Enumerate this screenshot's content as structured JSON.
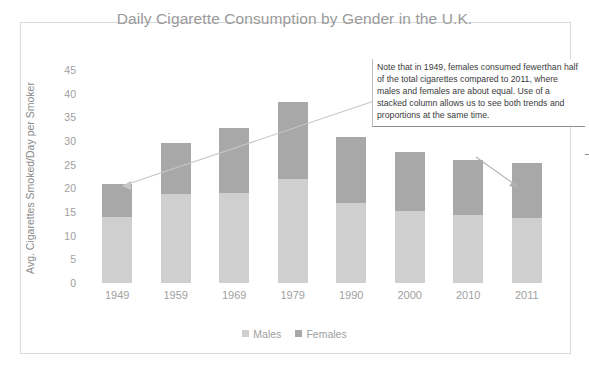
{
  "chart_data": {
    "type": "bar",
    "subtype": "stacked-column",
    "title": "Daily Cigarette Consumption by Gender in the U.K.",
    "xlabel": "",
    "ylabel": "Avg. Cigarettes Smoked/Day per Smoker",
    "categories": [
      "1949",
      "1959",
      "1969",
      "1979",
      "1990",
      "2000",
      "2010",
      "2011"
    ],
    "series": [
      {
        "name": "Males",
        "values": [
          14,
          18.8,
          19,
          22,
          17,
          15.3,
          14.4,
          13.7
        ],
        "color": "#cfcfcf"
      },
      {
        "name": "Females",
        "values": [
          7,
          10.7,
          13.8,
          16.3,
          13.8,
          12.4,
          11.6,
          11.6
        ],
        "color": "#a8a8a8"
      }
    ],
    "totals": [
      21,
      29.5,
      32.8,
      38.3,
      30.8,
      27.7,
      26.0,
      25.3
    ],
    "yticks": [
      "45",
      "40",
      "35",
      "30",
      "25",
      "20",
      "15",
      "10",
      "5",
      "0"
    ],
    "ytick_values": [
      45,
      40,
      35,
      30,
      25,
      20,
      15,
      10,
      5,
      0
    ],
    "ylim": [
      0,
      45
    ],
    "grid": false,
    "legend_position": "bottom",
    "legend": [
      "Males",
      "Females"
    ],
    "annotations": [
      {
        "name": "trend-arrow",
        "text": "",
        "from": "1979",
        "to": "1949",
        "style": "upward trend arrow across 1949-1979 tops"
      },
      {
        "name": "callout-arrow",
        "text": "",
        "from": "note-box",
        "to": "2011",
        "style": "arrow from note box down to 2011 column"
      }
    ],
    "note": "Note that in 1949, females consumed fewerthan half of the total cigarettes compared to 2011, where males and females are about equal.  Use of a stacked column allows us to see both trends and proportions at the same time."
  },
  "chart": {
    "title": "Daily Cigarette Consumption by Gender in the U.K.",
    "y_axis_title": "Avg. Cigarettes Smoked/Day per Smoker",
    "y_ticks": [
      "45",
      "40",
      "35",
      "30",
      "25",
      "20",
      "15",
      "10",
      "5",
      "0"
    ],
    "x_ticks": [
      "1949",
      "1959",
      "1969",
      "1979",
      "1990",
      "2000",
      "2010",
      "2011"
    ],
    "legend": [
      {
        "label": "Males",
        "color": "#cfcfcf"
      },
      {
        "label": "Females",
        "color": "#a8a8a8"
      }
    ]
  },
  "callout": {
    "text": "Note that in 1949, females consumed fewerthan half of the total cigarettes compared to 2011, where males and females are about equal.  Use of a stacked column allows us to see both trends and proportions at the same time."
  },
  "colors": {
    "males": "#cfcfcf",
    "females": "#a8a8a8",
    "title": "#9a9a9a",
    "tick": "#a0a0a0",
    "frame_border": "#d9d9d9",
    "arrow": "#bfbfbf"
  }
}
